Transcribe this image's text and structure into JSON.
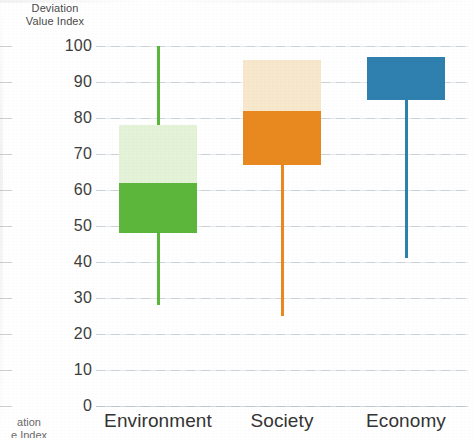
{
  "chart_data": {
    "type": "bar",
    "title": "",
    "ylabel": "Deviation Value Index",
    "ylabel_line1": "Deviation",
    "ylabel_line2": "Value Index",
    "ylabel_clip_line1": "ation",
    "ylabel_clip_line2": "e Index",
    "xlabel": "",
    "ylim": [
      0,
      100
    ],
    "ytick_step": 10,
    "yticks": [
      "100",
      "90",
      "80",
      "70",
      "60",
      "50",
      "40",
      "30",
      "20",
      "10",
      "0"
    ],
    "ytick_values": [
      100,
      90,
      80,
      70,
      60,
      50,
      40,
      30,
      20,
      10,
      0
    ],
    "grid": true,
    "grid_axis": "y",
    "legend": "none",
    "categories": [
      "Environment",
      "Society",
      "Economy"
    ],
    "series": [
      {
        "name": "Environment",
        "color": "#5CB63C",
        "light_color": "#E4F2D7",
        "whisker_low": 28,
        "box_low": 48,
        "box_mid": 62,
        "box_high": 78,
        "whisker_high": 100
      },
      {
        "name": "Society",
        "color": "#E8881F",
        "light_color": "#F7E7CB",
        "whisker_low": 25,
        "box_low": 67,
        "box_mid": 82,
        "box_high": 96,
        "whisker_high": 96
      },
      {
        "name": "Economy",
        "color": "#2F80AE",
        "light_color": "#2F80AE",
        "whisker_low": 41,
        "box_low": 85,
        "box_mid": 85,
        "box_high": 97,
        "whisker_high": 97
      }
    ]
  },
  "colors": {
    "environment": "#5CB63C",
    "environment_light": "#E4F2D7",
    "society": "#E8881F",
    "society_light": "#F7E7CB",
    "economy": "#2F80AE",
    "gridline": "#e4e9ee",
    "text": "#3a3a3a",
    "background": "#ffffff"
  }
}
